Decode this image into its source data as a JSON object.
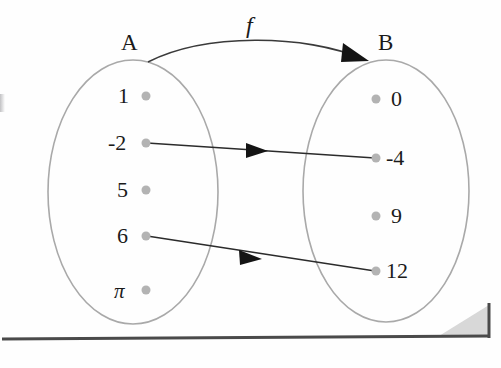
{
  "figure": {
    "type": "mapping-diagram",
    "function_label": "f",
    "domain": {
      "name": "A",
      "elements": [
        "1",
        "-2",
        "5",
        "6",
        "π"
      ]
    },
    "codomain": {
      "name": "B",
      "elements": [
        "0",
        "-4",
        "9",
        "12"
      ]
    },
    "mappings": [
      {
        "from": "-2",
        "to": "-4"
      },
      {
        "from": "6",
        "to": "12"
      }
    ],
    "colors": {
      "ellipse_stroke": "#a9a9a9",
      "dot_fill": "#b3b3b3",
      "arrow_stroke": "#2b2b2b",
      "text": "#1a1a1a",
      "page_rule": "#4a4a4a",
      "page_shadow": "#d6d6d6"
    }
  }
}
